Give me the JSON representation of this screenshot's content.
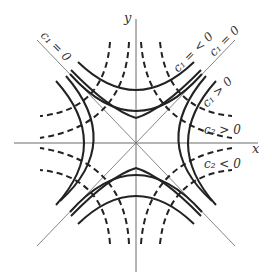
{
  "figure": {
    "x_axis_label": "x",
    "y_axis_label": "y",
    "labels": {
      "c1_zero_left": "c₁ = 0",
      "c1_zero_right": "c₁ = 0",
      "c1_neg": "c₁ = < 0",
      "c1_pos": "c₁ > 0",
      "c2_pos": "c₂ > 0",
      "c2_neg": "c₂ < 0"
    },
    "legend": {
      "solid": "family c₁ (hyperbolas x² − y² = c₁)",
      "dashed": "family c₂ (hyperbolas xy = c₂)"
    },
    "colors": {
      "curve": "#222222",
      "axis": "#6a6a6a",
      "label": "#333333"
    }
  }
}
